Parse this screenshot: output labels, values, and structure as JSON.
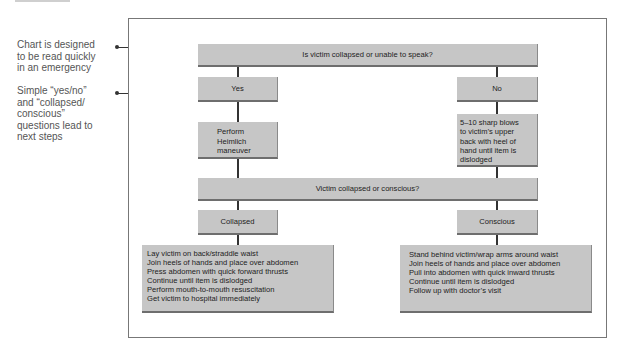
{
  "annotations": [
    {
      "text": "Chart is designed to be read quickly in an emergency",
      "lines": [
        "Chart is designed",
        "to be read quickly",
        "in an emergency"
      ]
    },
    {
      "text": "Simple “yes/no” and “collapsed/ conscious” questions lead to next steps",
      "lines": [
        "Simple “yes/no”",
        "and “collapsed/",
        "conscious”",
        "questions lead to",
        "next steps"
      ]
    }
  ],
  "flowchart": {
    "q1": "Is victim collapsed or unable to speak?",
    "yes": "Yes",
    "no": "No",
    "yes_action": [
      "Perform",
      "Heimlich",
      "maneuver"
    ],
    "no_action": [
      "5–10 sharp blows",
      "to victim’s upper",
      "back with heel of",
      "hand until item is",
      "dislodged"
    ],
    "q2": "Victim collapsed or conscious?",
    "collapsed": "Collapsed",
    "conscious": "Conscious",
    "collapsed_steps": [
      "Lay victim on back/straddle waist",
      "Join heels of hands and place over abdomen",
      "Press abdomen with quick forward thrusts",
      "Continue until item is dislodged",
      "Perform mouth-to-mouth resuscitation",
      "Get victim to hospital immediately"
    ],
    "conscious_steps": [
      "Stand behind victim/wrap arms around waist",
      "Join heels of hands and place over abdomen",
      "Pull into abdomen with quick inward thrusts",
      "Continue until item is dislodged",
      "Follow up with doctor’s visit"
    ]
  },
  "colors": {
    "box_fill": "#c6c6c6",
    "box_shadow": "#6e6e6e",
    "connector": "#333333",
    "frame": "#777777"
  }
}
